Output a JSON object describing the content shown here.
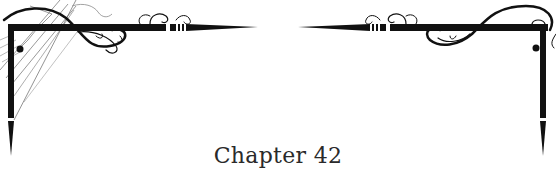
{
  "chapter": {
    "title": "Chapter 42"
  },
  "ornament": {
    "color": "#111111",
    "style": "decorative scroll corner frame"
  }
}
